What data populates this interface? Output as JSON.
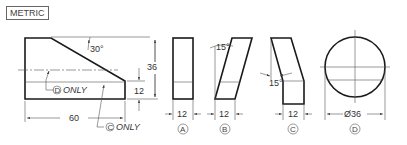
{
  "badge": "METRIC",
  "main_view": {
    "angle_label": "30°",
    "height_label": "36",
    "step_label": "12",
    "width_label": "60",
    "note_d": "ONLY",
    "note_c": "ONLY",
    "note_d_letter": "D",
    "note_c_letter": "C"
  },
  "options": [
    {
      "letter": "A",
      "dim": "12"
    },
    {
      "letter": "B",
      "dim": "12",
      "angle": "15°"
    },
    {
      "letter": "C",
      "dim": "12",
      "angle": "15°"
    },
    {
      "letter": "D",
      "dim": "Ø36"
    }
  ]
}
